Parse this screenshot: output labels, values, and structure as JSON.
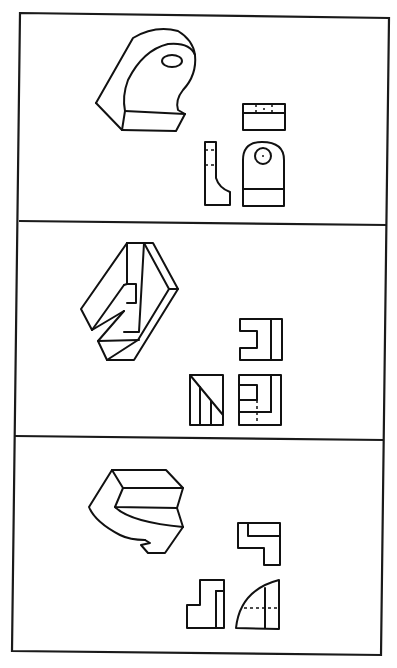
{
  "figure": {
    "colors": {
      "line": "#111111",
      "background": "#ffffff"
    },
    "panels": [
      {
        "id": 1,
        "isometric_label": "bracket with rounded top and circular hole",
        "views": [
          "top-view",
          "side-view",
          "front-view"
        ]
      },
      {
        "id": 2,
        "isometric_label": "slotted block with internal notch",
        "views": [
          "top-view",
          "side-view",
          "front-view"
        ]
      },
      {
        "id": 3,
        "isometric_label": "curved S-shaped step block",
        "views": [
          "top-view",
          "side-view",
          "front-view"
        ]
      }
    ]
  }
}
